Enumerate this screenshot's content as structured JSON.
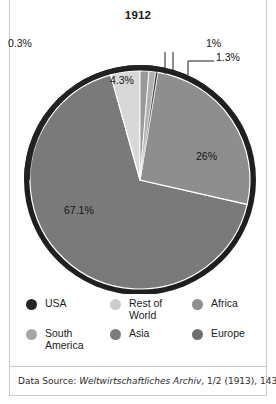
{
  "figure": {
    "title": "1912",
    "source_prefix": "Data Source: ",
    "source_italic": "Weltwirtschaftliches Archiv",
    "source_suffix": ", 1/2 (1913), 143."
  },
  "chart_data": {
    "type": "pie",
    "title": "1912",
    "xlabel": "",
    "ylabel": "",
    "legend_position": "bottom",
    "grid": false,
    "categories": [
      "USA",
      "South America",
      "Rest of World",
      "Asia",
      "Africa",
      "Europe"
    ],
    "values": [
      67.1,
      26,
      4.3,
      1.3,
      1,
      0.3
    ],
    "labels": [
      "67.1%",
      "26%",
      "4.3%",
      "1.3%",
      "1%",
      "0.3%"
    ],
    "slices": [
      {
        "name": "Europe",
        "value": 67.1,
        "label": "67.1%",
        "color": "#7a7a7a"
      },
      {
        "name": "Asia",
        "value": 26,
        "label": "26%",
        "color": "#8e8e8e"
      },
      {
        "name": "Rest of World",
        "value": 4.3,
        "label": "4.3%",
        "color": "#d8d8d8"
      },
      {
        "name": "South America",
        "value": 1.3,
        "label": "1.3%",
        "color": "#9a9a9a"
      },
      {
        "name": "Africa",
        "value": 1,
        "label": "1%",
        "color": "#b0b0b0"
      },
      {
        "name": "USA",
        "value": 0.3,
        "label": "0.3%",
        "color": "#2a2a2a"
      }
    ],
    "annotations": [
      {
        "text": "0.3%",
        "target": "USA"
      },
      {
        "text": "1%",
        "target": "Africa"
      },
      {
        "text": "1.3%",
        "target": "South America"
      }
    ]
  },
  "legend": {
    "items": [
      {
        "label": "USA",
        "color": "#262626"
      },
      {
        "label": "Rest of World",
        "color": "#cccccc"
      },
      {
        "label": "Africa",
        "color": "#8f8f8f"
      },
      {
        "label": "South America",
        "color": "#a6a6a6"
      },
      {
        "label": "Asia",
        "color": "#7b7b7b"
      },
      {
        "label": "Europe",
        "color": "#6f6f6f"
      }
    ]
  },
  "colors": {
    "rim": "#1f1f1f",
    "frame": "#c9c9c9",
    "text": "#141414",
    "background": "#ffffff"
  }
}
